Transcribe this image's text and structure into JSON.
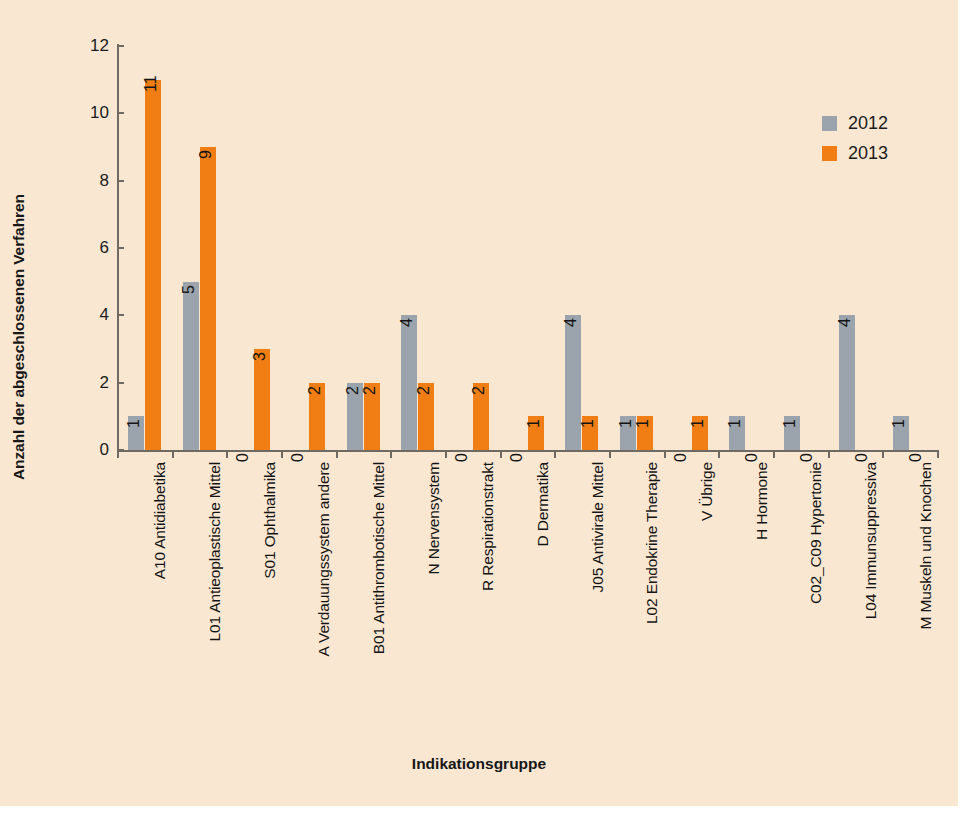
{
  "chart_data": {
    "type": "bar",
    "title": "",
    "xlabel": "Indikationsgruppe",
    "ylabel": "Anzahl der abgeschlossenen Verfahren",
    "ylim": [
      0,
      12
    ],
    "yticks": [
      0,
      2,
      4,
      6,
      8,
      10,
      12
    ],
    "grid": false,
    "legend_position": "top-right",
    "categories": [
      "A10  Antidiabetika",
      "L01  Antieoplastische Mittel",
      "S01  Ophthalmika",
      "A  Verdauungssystem andere",
      "B01  Antithrombotische Mittel",
      "N  Nervensystem",
      "R  Respirationstrakt",
      "D  Dermatika",
      "J05  Antivirale Mittel",
      "L02  Endokrine Therapie",
      "V  Übrige",
      "H  Hormone",
      "C02_C09  Hypertonie",
      "L04  Immunsuppressiva",
      "M  Muskeln und Knochen"
    ],
    "series": [
      {
        "name": "2012",
        "color": "#9ba4ac",
        "values": [
          1,
          5,
          0,
          0,
          2,
          4,
          0,
          0,
          4,
          1,
          0,
          1,
          1,
          4,
          1
        ]
      },
      {
        "name": "2013",
        "color": "#f07e14",
        "values": [
          11,
          9,
          3,
          2,
          2,
          2,
          2,
          1,
          1,
          1,
          1,
          0,
          0,
          0,
          0
        ]
      }
    ]
  },
  "legend": {
    "items": [
      {
        "label": "2012",
        "color": "#9ba4ac"
      },
      {
        "label": "2013",
        "color": "#f07e14"
      }
    ]
  },
  "colors": {
    "background": "#fae7d2",
    "axis": "#6e6a63",
    "text": "#141414",
    "series_2012": "#9ba4ac",
    "series_2013": "#f07e14"
  }
}
